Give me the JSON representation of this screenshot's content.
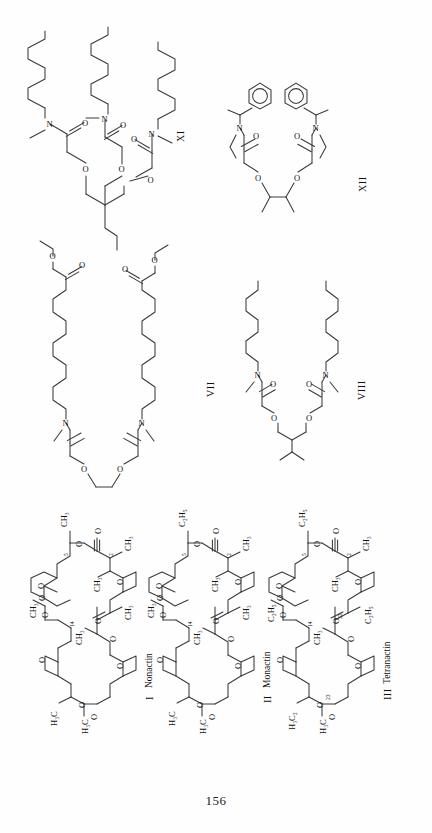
{
  "document": {
    "page_number": "156",
    "orientation": "rotated-90-ccw",
    "background_color": "#fefefe",
    "ink_color": "#3a3a3a"
  },
  "structures": [
    {
      "id": "XI",
      "roman_label": "XI",
      "name": "",
      "row": "top-left",
      "atom_labels": [
        "N",
        "N",
        "N",
        "O",
        "O",
        "O",
        "O",
        "O"
      ],
      "description_atoms": {
        "N_count": 3,
        "O_ether_count": 2,
        "O_carbonyl_count": 3
      }
    },
    {
      "id": "XII",
      "roman_label": "XII",
      "name": "",
      "row": "top-right",
      "atom_labels": [
        "N",
        "N",
        "O",
        "O",
        "O",
        "O"
      ],
      "description_atoms": {
        "N_count": 2,
        "O_ether_count": 2,
        "O_carbonyl_count": 2,
        "phenyl_rings": 2
      }
    },
    {
      "id": "VII",
      "roman_label": "VII",
      "name": "",
      "row": "middle-left",
      "atom_labels": [
        "N",
        "N",
        "O",
        "O",
        "O",
        "O",
        "O",
        "O"
      ],
      "description_atoms": {
        "N_count": 2,
        "O_ether_count": 2,
        "O_carbonyl_count": 2,
        "O_ester_count": 2
      }
    },
    {
      "id": "VIII",
      "roman_label": "VIII",
      "name": "",
      "row": "middle-right",
      "atom_labels": [
        "N",
        "N",
        "O",
        "O",
        "O",
        "O"
      ],
      "description_atoms": {
        "N_count": 2,
        "O_ether_count": 2,
        "O_carbonyl_count": 2
      }
    },
    {
      "id": "I",
      "roman_label": "I",
      "name": "Nonactin",
      "row": "bottom-1",
      "position_numbers": [
        "5",
        "2",
        "14"
      ],
      "substituents": [
        "CH₃",
        "CH₃",
        "CH₃",
        "CH₃",
        "CH₃",
        "CH₃",
        "H₃C",
        "H₃C"
      ],
      "atom_labels": [
        "O",
        "O",
        "O",
        "O",
        "O",
        "O",
        "O",
        "O",
        "O",
        "O",
        "O",
        "O"
      ]
    },
    {
      "id": "II",
      "roman_label": "II",
      "name": "Monactin",
      "row": "bottom-2",
      "position_numbers": [
        "5",
        "2",
        "14"
      ],
      "substituents": [
        "C₂H₅",
        "CH₃",
        "CH₃",
        "CH₃",
        "CH₃",
        "CH₃",
        "H₃C",
        "H₃C"
      ],
      "atom_labels": [
        "O",
        "O",
        "O",
        "O",
        "O",
        "O",
        "O",
        "O",
        "O",
        "O",
        "O",
        "O"
      ]
    },
    {
      "id": "III",
      "roman_label": "III",
      "name": "Tetranactin",
      "row": "bottom-3",
      "position_numbers": [
        "5",
        "2",
        "14",
        "32",
        "23"
      ],
      "substituents": [
        "C₂H₅",
        "CH₃",
        "CH₃",
        "C₂H₅",
        "C₂H₅",
        "C₂H₅",
        "CH₃",
        "H₃C",
        "H₃C₂"
      ],
      "atom_labels": [
        "O",
        "O",
        "O",
        "O",
        "O",
        "O",
        "O",
        "O",
        "O",
        "O",
        "O",
        "O"
      ]
    }
  ],
  "glyphs": {
    "N": "N",
    "O": "O",
    "CH3": "CH₃",
    "C2H5": "C₂H₅",
    "H3C": "H₃C",
    "H3C2": "H₃C₂"
  },
  "labels": {
    "xi": "XI",
    "xii": "XII",
    "vii": "VII",
    "viii": "VIII",
    "i_roman": "I",
    "i_name": "Nonactin",
    "ii_roman": "II",
    "ii_name": "Monactin",
    "iii_roman": "III",
    "iii_name": "Tetranactin",
    "page_number": "156"
  }
}
